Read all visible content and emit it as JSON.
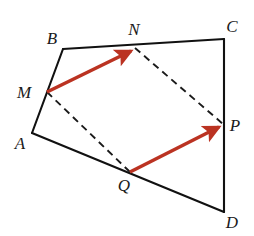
{
  "figure": {
    "background_color": "#ffffff",
    "stroke_color": "#111111",
    "vector_color": "#bb3322",
    "dashed_color": "#1a1a1a",
    "label_color": "#1a1a1a"
  },
  "points": {
    "A": {
      "label": "A",
      "x": 32,
      "y": 133,
      "label_x": 20,
      "label_y": 149
    },
    "B": {
      "label": "B",
      "x": 63,
      "y": 49,
      "label_x": 52,
      "label_y": 44
    },
    "C": {
      "label": "C",
      "x": 224,
      "y": 39,
      "label_x": 232,
      "label_y": 32
    },
    "D": {
      "label": "D",
      "x": 224,
      "y": 212,
      "label_x": 232,
      "label_y": 228
    },
    "M": {
      "label": "M",
      "x": 47,
      "y": 92,
      "label_x": 24,
      "label_y": 98
    },
    "N": {
      "label": "N",
      "x": 135,
      "y": 48,
      "label_x": 134,
      "label_y": 35
    },
    "P": {
      "label": "P",
      "x": 223,
      "y": 124,
      "label_x": 232,
      "label_y": 131
    },
    "Q": {
      "label": "Q",
      "x": 130,
      "y": 172,
      "label_x": 124,
      "label_y": 191
    }
  },
  "solid_edges": [
    {
      "name": "edge-A-B",
      "from": "A",
      "to": "B",
      "via": "M"
    },
    {
      "name": "edge-B-C",
      "from": "B",
      "to": "C",
      "via": "N"
    },
    {
      "name": "edge-C-D",
      "from": "C",
      "to": "D",
      "via": "P"
    },
    {
      "name": "edge-D-A",
      "from": "D",
      "to": "A",
      "via": "Q"
    }
  ],
  "dashed_segments": [
    {
      "name": "dashed-M-Q",
      "from": "M",
      "to": "Q"
    },
    {
      "name": "dashed-N-P",
      "from": "N",
      "to": "P"
    }
  ],
  "vectors": [
    {
      "name": "vector-M-N",
      "from": "M",
      "to": "N",
      "color": "#bb3322"
    },
    {
      "name": "vector-Q-P",
      "from": "Q",
      "to": "P",
      "color": "#bb3322"
    }
  ],
  "polyline_points": {
    "outline": "32,133 63,49 224,39 224,212 32,133"
  }
}
